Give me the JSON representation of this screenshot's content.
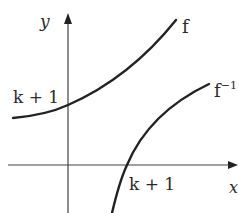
{
  "diagram": {
    "title": "",
    "colors": {
      "background": "#ffffff",
      "ink": "#222222",
      "axis": "#444444"
    },
    "axes": {
      "x_label": "x",
      "y_label": "y"
    },
    "curves": [
      {
        "id": "f",
        "label": "f",
        "description": "increasing convex curve crossing y-axis at k + 1"
      },
      {
        "id": "f_inverse",
        "label": "f",
        "label_superscript": "−1",
        "description": "increasing concave curve crossing x-axis at k + 1"
      }
    ],
    "annotations": {
      "y_intercept_label": "k + 1",
      "x_intercept_label": "k + 1"
    }
  }
}
